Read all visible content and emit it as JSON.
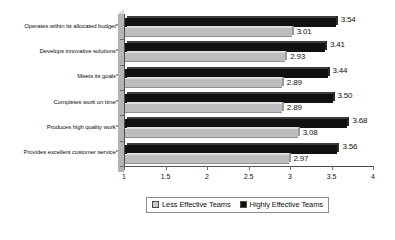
{
  "chart_data": {
    "type": "bar",
    "orientation": "horizontal",
    "title": "",
    "subtitle": "",
    "xlabel": "",
    "ylabel": "",
    "xlim": [
      1,
      4
    ],
    "xticks": [
      "1",
      "1.5",
      "2",
      "2.5",
      "3",
      "3.5",
      "4"
    ],
    "xtick_values": [
      1,
      1.5,
      2,
      2.5,
      3,
      3.5,
      4
    ],
    "grid": false,
    "legend_position": "bottom",
    "categories": [
      "Operates within its allocated budget*",
      "Develops innovative solutions*",
      "Meets its goals*",
      "Completes work on time*",
      "Produces high quality work*",
      "Provides excellent customer service*"
    ],
    "series": [
      {
        "name": "Highly Effective Teams",
        "color": "#111111",
        "values": [
          3.54,
          3.41,
          3.44,
          3.5,
          3.68,
          3.56
        ],
        "labels": [
          "3.54",
          "3.41",
          "3.44",
          "3.50",
          "3.68",
          "3.56"
        ]
      },
      {
        "name": "Less Effective Teams",
        "color": "#bdbdbd",
        "values": [
          3.01,
          2.93,
          2.89,
          2.89,
          3.08,
          2.97
        ],
        "labels": [
          "3.01",
          "2.93",
          "2.89",
          "2.89",
          "3.08",
          "2.97"
        ]
      }
    ]
  },
  "legend": {
    "items": [
      {
        "label": "Less Effective Teams",
        "swatch": "less"
      },
      {
        "label": "Highly Effective Teams",
        "swatch": "high"
      }
    ]
  }
}
